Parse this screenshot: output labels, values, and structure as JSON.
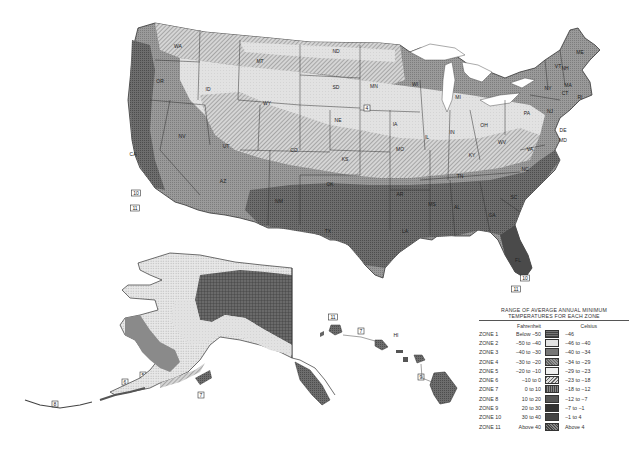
{
  "map": {
    "title": "USDA Plant Hardiness Zone Map",
    "regions": {
      "contiguous_us": {
        "state_labels": [
          {
            "id": "WA",
            "label": "WA",
            "x": 178,
            "y": 48
          },
          {
            "id": "OR",
            "label": "OR",
            "x": 160,
            "y": 83
          },
          {
            "id": "CA",
            "label": "CA",
            "x": 133,
            "y": 156
          },
          {
            "id": "ID",
            "label": "ID",
            "x": 208,
            "y": 91
          },
          {
            "id": "NV",
            "label": "NV",
            "x": 182,
            "y": 138
          },
          {
            "id": "MT",
            "label": "MT",
            "x": 260,
            "y": 63
          },
          {
            "id": "WY",
            "label": "WY",
            "x": 267,
            "y": 105
          },
          {
            "id": "UT",
            "label": "UT",
            "x": 226,
            "y": 148
          },
          {
            "id": "AZ",
            "label": "AZ",
            "x": 223,
            "y": 183
          },
          {
            "id": "CO",
            "label": "CO",
            "x": 294,
            "y": 152
          },
          {
            "id": "NM",
            "label": "NM",
            "x": 279,
            "y": 203
          },
          {
            "id": "ND",
            "label": "ND",
            "x": 336,
            "y": 53
          },
          {
            "id": "SD",
            "label": "SD",
            "x": 336,
            "y": 89
          },
          {
            "id": "NE",
            "label": "NE",
            "x": 338,
            "y": 122
          },
          {
            "id": "KS",
            "label": "KS",
            "x": 345,
            "y": 161
          },
          {
            "id": "OK",
            "label": "OK",
            "x": 330,
            "y": 186
          },
          {
            "id": "TX",
            "label": "TX",
            "x": 328,
            "y": 233
          },
          {
            "id": "MN",
            "label": "MN",
            "x": 374,
            "y": 88
          },
          {
            "id": "IA",
            "label": "IA",
            "x": 395,
            "y": 126
          },
          {
            "id": "MO",
            "label": "MO",
            "x": 400,
            "y": 151
          },
          {
            "id": "AR",
            "label": "AR",
            "x": 400,
            "y": 196
          },
          {
            "id": "LA",
            "label": "LA",
            "x": 405,
            "y": 233
          },
          {
            "id": "WI",
            "label": "WI",
            "x": 415,
            "y": 86
          },
          {
            "id": "IL",
            "label": "IL",
            "x": 427,
            "y": 139
          },
          {
            "id": "MI",
            "label": "MI",
            "x": 458,
            "y": 99
          },
          {
            "id": "IN",
            "label": "IN",
            "x": 452,
            "y": 134
          },
          {
            "id": "OH",
            "label": "OH",
            "x": 484,
            "y": 127
          },
          {
            "id": "KY",
            "label": "KY",
            "x": 472,
            "y": 157
          },
          {
            "id": "TN",
            "label": "TN",
            "x": 460,
            "y": 178
          },
          {
            "id": "MS",
            "label": "MS",
            "x": 432,
            "y": 206
          },
          {
            "id": "AL",
            "label": "AL",
            "x": 457,
            "y": 209
          },
          {
            "id": "GA",
            "label": "GA",
            "x": 492,
            "y": 217
          },
          {
            "id": "FL",
            "label": "FL",
            "x": 518,
            "y": 262
          },
          {
            "id": "SC",
            "label": "SC",
            "x": 514,
            "y": 199
          },
          {
            "id": "NC",
            "label": "NC",
            "x": 525,
            "y": 171
          },
          {
            "id": "VA",
            "label": "VA",
            "x": 530,
            "y": 151
          },
          {
            "id": "WV",
            "label": "WV",
            "x": 502,
            "y": 144
          },
          {
            "id": "PA",
            "label": "PA",
            "x": 527,
            "y": 115
          },
          {
            "id": "NY",
            "label": "NY",
            "x": 548,
            "y": 90
          },
          {
            "id": "ME",
            "label": "ME",
            "x": 580,
            "y": 54
          },
          {
            "id": "NH",
            "label": "NH",
            "x": 565,
            "y": 70
          },
          {
            "id": "VT",
            "label": "VT",
            "x": 558,
            "y": 68
          },
          {
            "id": "MA",
            "label": "MA",
            "x": 568,
            "y": 87
          },
          {
            "id": "CT",
            "label": "CT",
            "x": 565,
            "y": 95
          },
          {
            "id": "RI",
            "label": "RI",
            "x": 580,
            "y": 99
          },
          {
            "id": "NJ",
            "label": "NJ",
            "x": 550,
            "y": 113
          },
          {
            "id": "DE",
            "label": "DE",
            "x": 563,
            "y": 132
          },
          {
            "id": "MD",
            "label": "MD",
            "x": 563,
            "y": 142
          }
        ],
        "zone_tags": [
          {
            "label": "4",
            "x": 367,
            "y": 109
          },
          {
            "label": "10",
            "x": 136,
            "y": 194
          },
          {
            "label": "11",
            "x": 135,
            "y": 209
          },
          {
            "label": "10",
            "x": 525,
            "y": 279
          },
          {
            "label": "11",
            "x": 516,
            "y": 290
          }
        ]
      },
      "alaska": {
        "state_label": {
          "label": "AK",
          "x": 238,
          "y": 288
        },
        "zone_tags": [
          {
            "label": "1",
            "x": 220,
            "y": 300
          },
          {
            "label": "2",
            "x": 184,
            "y": 330
          },
          {
            "label": "3",
            "x": 165,
            "y": 343
          },
          {
            "label": "4",
            "x": 152,
            "y": 352
          },
          {
            "label": "5",
            "x": 143,
            "y": 376
          },
          {
            "label": "6",
            "x": 125,
            "y": 383
          },
          {
            "label": "7",
            "x": 201,
            "y": 396
          },
          {
            "label": "8",
            "x": 55,
            "y": 405
          }
        ]
      },
      "hawaii": {
        "state_label": {
          "label": "HI",
          "x": 396,
          "y": 337
        },
        "zone_tags": [
          {
            "label": "11",
            "x": 333,
            "y": 318
          },
          {
            "label": "7",
            "x": 361,
            "y": 332
          },
          {
            "label": "9",
            "x": 421,
            "y": 378
          },
          {
            "label": "10",
            "x": 443,
            "y": 389
          }
        ]
      }
    }
  },
  "legend": {
    "title_line1": "RANGE OF AVERAGE ANNUAL MINIMUM",
    "title_line2": "TEMPERATURES FOR EACH ZONE",
    "fahrenheit_header": "Fahrenheit",
    "celsius_header": "Celsius",
    "zones": [
      {
        "zone": "ZONE 1",
        "fahrenheit": "Below −50",
        "celsius": "−46",
        "pattern": "grid-dark",
        "color": "#555555"
      },
      {
        "zone": "ZONE 2",
        "fahrenheit": "−50 to −40",
        "celsius": "−46 to −40",
        "pattern": "dots-light",
        "color": "#d8d8d8"
      },
      {
        "zone": "ZONE 3",
        "fahrenheit": "−40 to −30",
        "celsius": "−40 to −34",
        "pattern": "dots-dense",
        "color": "#bdbdbd"
      },
      {
        "zone": "ZONE 4",
        "fahrenheit": "−30 to −20",
        "celsius": "−34 to −29",
        "pattern": "hatch-dark",
        "color": "#8a8a8a"
      },
      {
        "zone": "ZONE 5",
        "fahrenheit": "−20 to −10",
        "celsius": "−29 to −23",
        "pattern": "light-plain",
        "color": "#e6e6e6"
      },
      {
        "zone": "ZONE 6",
        "fahrenheit": "−10 to 0",
        "celsius": "−23 to −18",
        "pattern": "diagonal",
        "color": "#b0b0b0"
      },
      {
        "zone": "ZONE 7",
        "fahrenheit": "0 to 10",
        "celsius": "−18 to −12",
        "pattern": "vertical-dark",
        "color": "#6f6f6f"
      },
      {
        "zone": "ZONE 8",
        "fahrenheit": "10 to 20",
        "celsius": "−12 to −7",
        "pattern": "stipple-mid",
        "color": "#8f8f8f"
      },
      {
        "zone": "ZONE 9",
        "fahrenheit": "20 to 30",
        "celsius": "−7 to −1",
        "pattern": "stipple-dark",
        "color": "#7a7a7a"
      },
      {
        "zone": "ZONE 10",
        "fahrenheit": "30 to 40",
        "celsius": "−1 to 4",
        "pattern": "solid-dark",
        "color": "#4a4a4a"
      },
      {
        "zone": "ZONE 11",
        "fahrenheit": "Above 40",
        "celsius": "Above 4",
        "pattern": "cross-dark",
        "color": "#5e5e5e"
      }
    ]
  }
}
